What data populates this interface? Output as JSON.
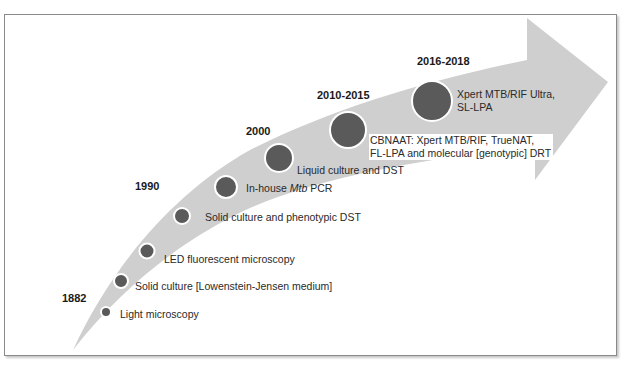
{
  "diagram": {
    "arrow_color": "#cfcfcf",
    "milestone_color": "#5a5a5a",
    "years": [
      {
        "label": "1882"
      },
      {
        "label": "1990"
      },
      {
        "label": "2000"
      },
      {
        "label": "2010-2015"
      },
      {
        "label": "2016-2018"
      }
    ],
    "milestones": [
      {
        "label": "Light microscopy"
      },
      {
        "label": "Solid culture [Lowenstein-Jensen medium]"
      },
      {
        "label": "LED fluorescent microscopy"
      },
      {
        "label": "Solid culture and phenotypic DST"
      },
      {
        "label_pre": "In-house ",
        "label_italic": "Mtb",
        "label_post": " PCR"
      },
      {
        "label": "Liquid culture and DST"
      },
      {
        "line1": "CBNAAT: Xpert MTB/RIF, TrueNAT,",
        "line2": "FL-LPA and molecular [genotypic] DRT"
      },
      {
        "line1": "Xpert MTB/RIF Ultra,",
        "line2": "SL-LPA"
      }
    ]
  }
}
